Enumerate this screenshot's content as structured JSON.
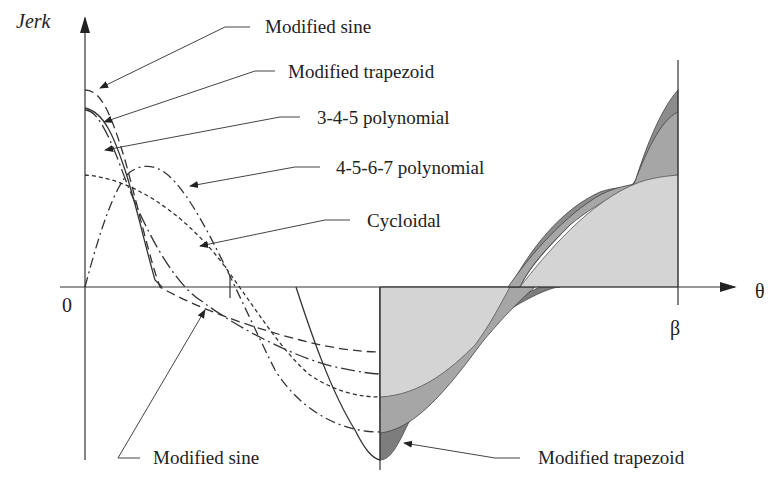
{
  "axes": {
    "y_label": "Jerk",
    "x_label": "θ",
    "origin_label": "0",
    "end_label": "β"
  },
  "callouts": [
    {
      "id": "modified-sine-top",
      "label": "Modified sine"
    },
    {
      "id": "modified-trapezoid-top",
      "label": "Modified trapezoid"
    },
    {
      "id": "poly-345",
      "label": "3-4-5 polynomial"
    },
    {
      "id": "poly-4567",
      "label": "4-5-6-7 polynomial"
    },
    {
      "id": "cycloidal",
      "label": "Cycloidal"
    },
    {
      "id": "modified-sine-bottom",
      "label": "Modified sine"
    },
    {
      "id": "modified-trapezoid-bottom",
      "label": "Modified trapezoid"
    }
  ],
  "colors": {
    "light_fill": "#d4d4d4",
    "mid_fill": "#a6a6a6",
    "dark_fill": "#7d7d7d",
    "ink": "#333333"
  }
}
